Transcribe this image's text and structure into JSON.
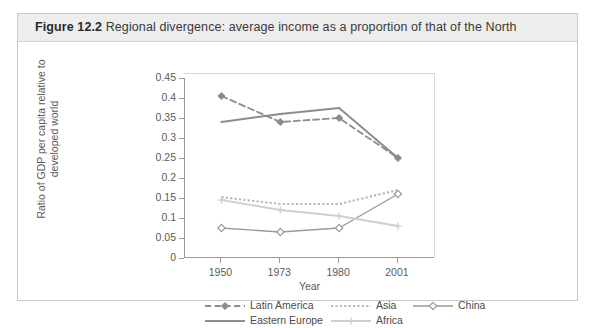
{
  "figure": {
    "label": "Figure 12.2",
    "caption": "Regional divergence: average income as a proportion of that of the North"
  },
  "chart_data": {
    "type": "line",
    "title": "Regional divergence: average income as a proportion of that of the North",
    "xlabel": "Year",
    "ylabel": "Ratio of GDP per capita relative to developed world",
    "categories": [
      "1950",
      "1973",
      "1980",
      "2001"
    ],
    "x_tick_labels": [
      "1950",
      "1973",
      "1980",
      "2001"
    ],
    "y_tick_labels": [
      "0",
      "0.05",
      "0.1",
      "0.15",
      "0.2",
      "0.25",
      "0.3",
      "0.35",
      "0.4",
      "0.45"
    ],
    "y_tick_values": [
      0,
      0.05,
      0.1,
      0.15,
      0.2,
      0.25,
      0.3,
      0.35,
      0.4,
      0.45
    ],
    "ylim": [
      0,
      0.45
    ],
    "grid": false,
    "legend_position": "bottom",
    "series": [
      {
        "name": "Latin America",
        "values": [
          0.405,
          0.34,
          0.35,
          0.25
        ],
        "color": "#8c8c8c",
        "line_style": "dashed",
        "marker": "diamond-filled",
        "line_width": 1.8
      },
      {
        "name": "Asia",
        "values": [
          0.152,
          0.135,
          0.135,
          0.17
        ],
        "color": "#b9b9b9",
        "line_style": "dotted",
        "marker": "none",
        "line_width": 2.2
      },
      {
        "name": "China",
        "values": [
          0.075,
          0.065,
          0.075,
          0.16
        ],
        "color": "#9a9a9a",
        "line_style": "solid",
        "marker": "diamond-open",
        "line_width": 1.4
      },
      {
        "name": "Eastern Europe",
        "values": [
          0.34,
          0.36,
          0.375,
          0.25
        ],
        "color": "#8c8c8c",
        "line_style": "solid",
        "marker": "none",
        "line_width": 2.0
      },
      {
        "name": "Africa",
        "values": [
          0.145,
          0.12,
          0.105,
          0.08
        ],
        "color": "#cfcfcf",
        "line_style": "solid",
        "marker": "plus",
        "line_width": 1.8
      }
    ]
  },
  "legend": {
    "entries": [
      {
        "label": "Latin America"
      },
      {
        "label": "Asia"
      },
      {
        "label": "China"
      },
      {
        "label": "Eastern Europe"
      },
      {
        "label": "Africa"
      }
    ]
  }
}
